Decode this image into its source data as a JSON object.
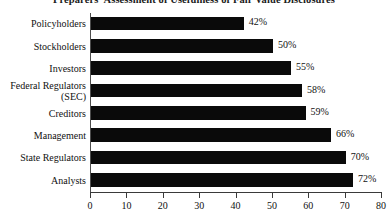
{
  "chart_data": {
    "type": "bar",
    "orientation": "horizontal",
    "title": "Preparers' Assessment of Usefulness of Fair Value Disclosures",
    "xlabel": "",
    "ylabel": "",
    "xlim": [
      0,
      80
    ],
    "xticks": [
      0,
      10,
      20,
      30,
      40,
      50,
      60,
      70,
      80
    ],
    "xtick_labels": [
      "0",
      "10",
      "20",
      "30",
      "40",
      "50",
      "60",
      "70",
      "80"
    ],
    "grid": false,
    "legend": false,
    "bar_color": "#0a0a0a",
    "categories": [
      "Policyholders",
      "Stockholders",
      "Investors",
      "Federal Regulators\n(SEC)",
      "Creditors",
      "Management",
      "State Regulators",
      "Analysts"
    ],
    "values": [
      42,
      50,
      55,
      58,
      59,
      66,
      70,
      72
    ],
    "value_labels": [
      "42%",
      "50%",
      "55%",
      "58%",
      "59%",
      "66%",
      "70%",
      "72%"
    ]
  }
}
